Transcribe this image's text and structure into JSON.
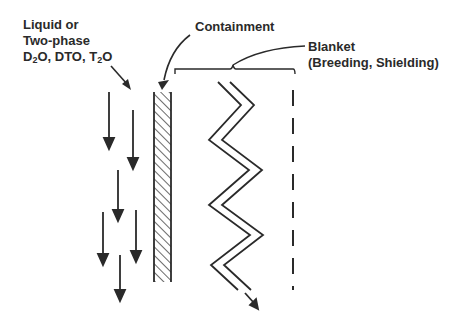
{
  "labels": {
    "coolant_line1": "Liquid or",
    "coolant_line2": "Two-phase",
    "coolant_line3_parts": [
      "D",
      "2",
      "O, DTO, T",
      "2",
      "O"
    ],
    "containment": "Containment",
    "blanket_line1": "Blanket",
    "blanket_line2": "(Breeding, Shielding)"
  },
  "colors": {
    "ink": "#2a2a2a",
    "background": "#ffffff"
  },
  "elements": {
    "flow_arrows": 7,
    "containment_wall": "hatched",
    "blanket_channel": "zigzag double line",
    "outer_boundary": "dashed line"
  }
}
